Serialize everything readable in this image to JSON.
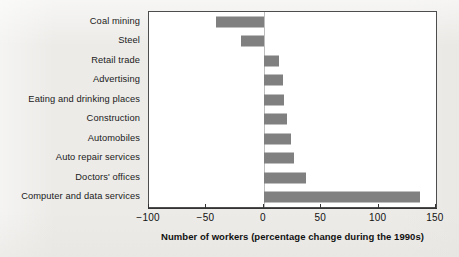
{
  "chart_data": {
    "type": "bar",
    "orientation": "horizontal",
    "title": "",
    "subtitle": "",
    "xlabel": "Number of workers (percentage change during the 1990s)",
    "ylabel": "",
    "categories": [
      "Coal mining",
      "Steel",
      "Retail trade",
      "Advertising",
      "Eating and drinking places",
      "Construction",
      "Automobiles",
      "Auto repair services",
      "Doctors' offices",
      "Computer and data services"
    ],
    "values": [
      -42,
      -20,
      13,
      17,
      18,
      20,
      24,
      26,
      37,
      136
    ],
    "xlim": [
      -100,
      150
    ],
    "xticks": [
      -100,
      -50,
      0,
      50,
      100,
      150
    ],
    "xticklabels": [
      "−100",
      "−50",
      "0",
      "50",
      "100",
      "150"
    ],
    "grid": false,
    "legend": null,
    "bar_color": "#808080",
    "plot_background": "#ffffff",
    "page_background": "#ecebe8",
    "frame_color": "#4d4d4d"
  }
}
